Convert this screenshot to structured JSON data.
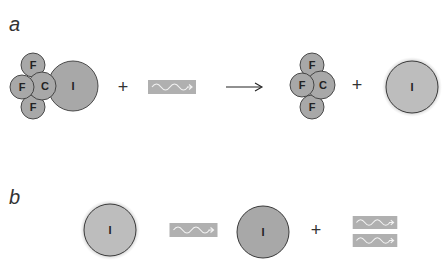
{
  "panels": {
    "a": {
      "label": "a"
    },
    "b": {
      "label": "b"
    }
  },
  "atoms": {
    "fluorine": "F",
    "carbon": "C",
    "iodine": "I"
  },
  "operators": {
    "plus": "+",
    "arrow": "→"
  },
  "colors": {
    "atom_fill": "#a8a8a8",
    "excited_atom_fill": "#bdbdbd",
    "atom_stroke": "#3a3a3a",
    "halo": "#d4d4d4",
    "photon_box": "#b0b0b0",
    "photon_wave": "#f2f2f2"
  },
  "diagram": {
    "panel_a": {
      "reactants": [
        "CF3I molecule",
        "photon"
      ],
      "products": [
        "CF3 radical",
        "excited I atom"
      ]
    },
    "panel_b": {
      "reactants": [
        "excited I atom",
        "photon"
      ],
      "products": [
        "ground-state I atom",
        "photon",
        "photon"
      ]
    }
  }
}
